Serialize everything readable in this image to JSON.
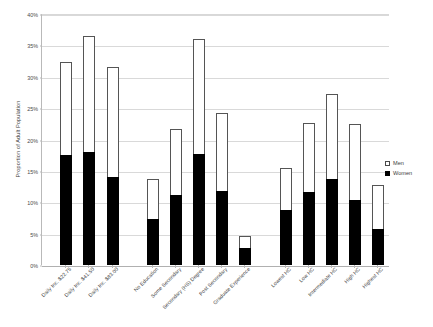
{
  "chart_data": {
    "type": "bar",
    "title": "",
    "subtitle": "",
    "xlabel": "",
    "ylabel": "Proportion of Adult Population",
    "ylim": [
      0,
      40
    ],
    "ytick_labels": [
      "0%",
      "5%",
      "10%",
      "15%",
      "20%",
      "25%",
      "30%",
      "35%",
      "40%"
    ],
    "ytick_values": [
      0,
      5,
      10,
      15,
      20,
      25,
      30,
      35,
      40
    ],
    "grid": true,
    "stacked": true,
    "legend_position": "right",
    "bar_unit": "%",
    "categories": [
      "Daily Inc. $22.75",
      "Daily Inc. $41.50",
      "Daily Inc. $83.00",
      "No Education",
      "Some Secondary",
      "Secondary (HS) Degree",
      "Post Secondary",
      "Graduate Experience",
      "Lowest HC",
      "Low HC",
      "Intermediate HC",
      "High HC",
      "Highest HC"
    ],
    "group_breaks_after": [
      2,
      7
    ],
    "series": [
      {
        "name": "Women",
        "color": "#000000",
        "values": [
          17.5,
          18.0,
          14.0,
          7.3,
          11.2,
          17.7,
          11.8,
          2.7,
          8.8,
          11.7,
          13.7,
          10.3,
          5.7
        ]
      },
      {
        "name": "Men",
        "color": "#ffffff",
        "values": [
          14.8,
          18.5,
          17.5,
          6.4,
          10.5,
          18.3,
          12.5,
          1.9,
          6.7,
          11.0,
          13.5,
          12.2,
          7.0
        ]
      }
    ],
    "totals": [
      32.3,
      36.5,
      31.5,
      13.7,
      21.7,
      36.0,
      24.3,
      4.6,
      15.5,
      22.7,
      27.2,
      22.5,
      12.7
    ]
  },
  "legend": {
    "items": [
      {
        "label": "Men",
        "marker": "open-square"
      },
      {
        "label": "Women",
        "marker": "filled-square"
      }
    ]
  }
}
